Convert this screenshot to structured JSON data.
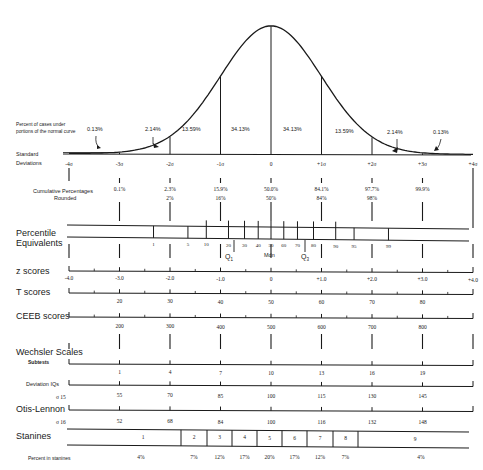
{
  "chart_data": {
    "type": "diagram",
    "curve": {
      "caption": "Percent of cases under portions of the normal curve",
      "caption_line1": "Percent of cases under",
      "caption_line2": "portions of the normal curve",
      "segment_percents": [
        "0.13%",
        "2.14%",
        "13.59%",
        "34.13%",
        "34.13%",
        "13.59%",
        "2.14%",
        "0.13%"
      ]
    },
    "standard_deviations": {
      "label_line1": "Standard",
      "label_line2": "Deviations",
      "ticks": [
        "-4σ",
        "-3σ",
        "-2σ",
        "-1σ",
        "0",
        "+1σ",
        "+2σ",
        "+3σ",
        "+4σ"
      ]
    },
    "cumulative_percentages": {
      "label": "Cumulative Percentages",
      "values": [
        "0.1%",
        "2.3%",
        "15.9%",
        "50.0%",
        "84.1%",
        "97.7%",
        "99.9%"
      ]
    },
    "rounded": {
      "label": "Rounded",
      "values": [
        "2%",
        "16%",
        "50%",
        "84%",
        "98%"
      ]
    },
    "percentile_equivalents": {
      "label_line1": "Percentile",
      "label_line2": "Equivalents",
      "values": [
        "1",
        "5",
        "10",
        "20",
        "30",
        "40",
        "50",
        "60",
        "70",
        "80",
        "90",
        "95",
        "99"
      ],
      "q1": "Q1",
      "median": "Mdn",
      "q3": "Q3"
    },
    "z_scores": {
      "label": "z  scores",
      "values": [
        "-4.0",
        "-3.0",
        "-2.0",
        "-1.0",
        "0",
        "+1.0",
        "+2.0",
        "+3.0",
        "+4.0"
      ]
    },
    "t_scores": {
      "label": "T  scores",
      "values": [
        "20",
        "30",
        "40",
        "50",
        "60",
        "70",
        "80"
      ]
    },
    "ceeb_scores": {
      "label": "CEEB scores",
      "values": [
        "200",
        "300",
        "400",
        "500",
        "600",
        "700",
        "800"
      ]
    },
    "wechsler": {
      "label": "Wechsler Scales",
      "subtests_label": "Subtests",
      "subtests": [
        "1",
        "4",
        "7",
        "10",
        "13",
        "16",
        "19"
      ],
      "deviation_iq_label": "Deviation IQs",
      "sigma_label": "σ 15",
      "deviation_iqs": [
        "55",
        "70",
        "85",
        "100",
        "115",
        "130",
        "145"
      ]
    },
    "otis_lennon": {
      "label": "Otis-Lennon",
      "sigma_label": "σ 16",
      "values": [
        "52",
        "68",
        "84",
        "100",
        "116",
        "132",
        "148"
      ]
    },
    "stanines": {
      "label": "Stanines",
      "values": [
        "1",
        "2",
        "3",
        "4",
        "5",
        "6",
        "7",
        "8",
        "9"
      ],
      "percent_label": "Percent in stanines",
      "percents": [
        "4%",
        "7%",
        "12%",
        "17%",
        "20%",
        "17%",
        "12%",
        "7%",
        "4%"
      ]
    }
  }
}
